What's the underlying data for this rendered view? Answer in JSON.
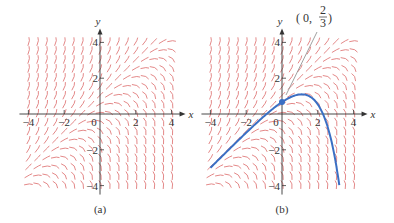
{
  "figure": {
    "differential_equation_slope": "y - x",
    "field_color": "#e07a7a",
    "axis_color": "#333333",
    "curve_color": "#3a6fc4",
    "panels": [
      {
        "id": "a",
        "caption": "(a)",
        "x_axis_label": "x",
        "y_axis_label": "y",
        "x_ticks": [
          "-4",
          "-2",
          "0",
          "2",
          "4"
        ],
        "y_ticks": [
          "4",
          "2",
          "-2",
          "-4"
        ],
        "origin_px": [
          100,
          114
        ],
        "unit_px": 17.9
      },
      {
        "id": "b",
        "caption": "(b)",
        "x_axis_label": "x",
        "y_axis_label": "y",
        "x_ticks": [
          "-4",
          "-2",
          "0",
          "2",
          "4"
        ],
        "y_ticks": [
          "4",
          "2",
          "-2",
          "-4"
        ],
        "origin_px": [
          282,
          114
        ],
        "unit_px": 17.9,
        "initial_point": {
          "x": 0,
          "y": 0.6667,
          "label_prefix": "0, ",
          "label_num": "2",
          "label_den": "3"
        },
        "solution_curve": {
          "formula": "y = x + 1 - e^x / 3",
          "x_range": [
            -4,
            3.2
          ]
        }
      }
    ]
  },
  "chart_data": {
    "type": "line",
    "title": "",
    "xlabel": "x",
    "ylabel": "y",
    "xlim": [
      -4,
      4
    ],
    "ylim": [
      -4,
      4
    ],
    "x_ticks": [
      -4,
      -2,
      0,
      2,
      4
    ],
    "y_ticks": [
      -4,
      -2,
      2,
      4
    ],
    "grid": false,
    "panels": [
      "(a) slope field",
      "(b) slope field with solution curve"
    ],
    "annotation": "(0, 2/3)",
    "series": [
      {
        "name": "solution through (0, 2/3)",
        "x": [
          -4,
          -3,
          -2,
          -1,
          0,
          0.5,
          1,
          1.1,
          1.5,
          2,
          2.5,
          3,
          3.2
        ],
        "y": [
          -3.01,
          -2.02,
          -1.05,
          -0.12,
          0.67,
          0.95,
          1.09,
          1.1,
          1.01,
          0.54,
          -0.56,
          -2.7,
          -3.93
        ]
      }
    ]
  }
}
